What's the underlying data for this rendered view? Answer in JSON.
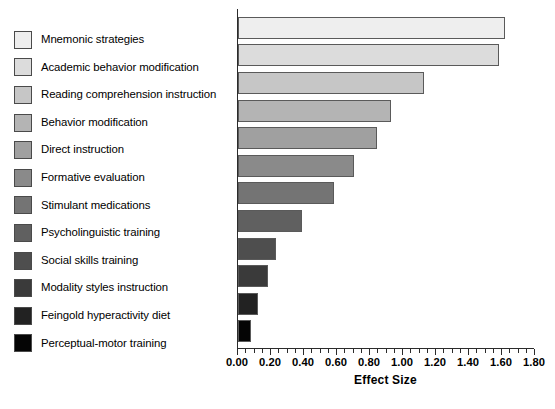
{
  "chart_data": {
    "type": "bar",
    "orientation": "horizontal",
    "title": "",
    "xlabel": "Effect Size",
    "ylabel": "",
    "xlim": [
      0.0,
      1.8
    ],
    "xticks": [
      "0.00",
      "0.20",
      "0.40",
      "0.60",
      "0.80",
      "1.00",
      "1.20",
      "1.40",
      "1.60",
      "1.80"
    ],
    "xtick_values": [
      0.0,
      0.2,
      0.4,
      0.6,
      0.8,
      1.0,
      1.2,
      1.4,
      1.6,
      1.8
    ],
    "minor_tick_step": 0.05,
    "grid": false,
    "legend_position": "left",
    "categories": [
      "Mnemonic strategies",
      "Academic behavior modification",
      "Reading comprehension instruction",
      "Behavior modification",
      "Direct instruction",
      "Formative evaluation",
      "Stimulant medications",
      "Psycholinguistic training",
      "Social skills training",
      "Modality styles instruction",
      "Feingold hyperactivity diet",
      "Perceptual-motor training"
    ],
    "values": [
      1.62,
      1.58,
      1.13,
      0.93,
      0.84,
      0.7,
      0.58,
      0.39,
      0.23,
      0.18,
      0.12,
      0.08
    ],
    "colors": [
      "#eeeeee",
      "#dcdcdc",
      "#c6c6c6",
      "#b4b4b4",
      "#a0a0a0",
      "#8a8a8a",
      "#747474",
      "#606060",
      "#4e4e4e",
      "#3a3a3a",
      "#222222",
      "#050505"
    ]
  }
}
